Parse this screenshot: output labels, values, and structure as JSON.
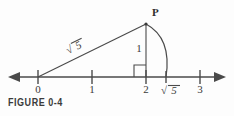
{
  "figure": {
    "caption": "FIGURE 0-4",
    "point_label": "P",
    "hypotenuse_label": "5",
    "hypotenuse_radical": "√",
    "vertical_label": "1",
    "irrational_tick_label": "5",
    "irrational_tick_radical": "√",
    "colors": {
      "ink": "#4a4a4a",
      "text": "#3a3a3a",
      "caption": "#3b3b3b",
      "background": "#fdfdfd"
    },
    "axis": {
      "tick_labels": [
        "0",
        "1",
        "2",
        "3"
      ],
      "tick_values": [
        0,
        1,
        2,
        3
      ],
      "left_arrow": "arrow-left",
      "right_arrow": "arrow-right"
    },
    "geometry": {
      "leg_horizontal": 2,
      "leg_vertical": 1,
      "hypotenuse": 2.2360679,
      "arc_radius": 2.2360679,
      "right_angle_at": 2
    }
  }
}
